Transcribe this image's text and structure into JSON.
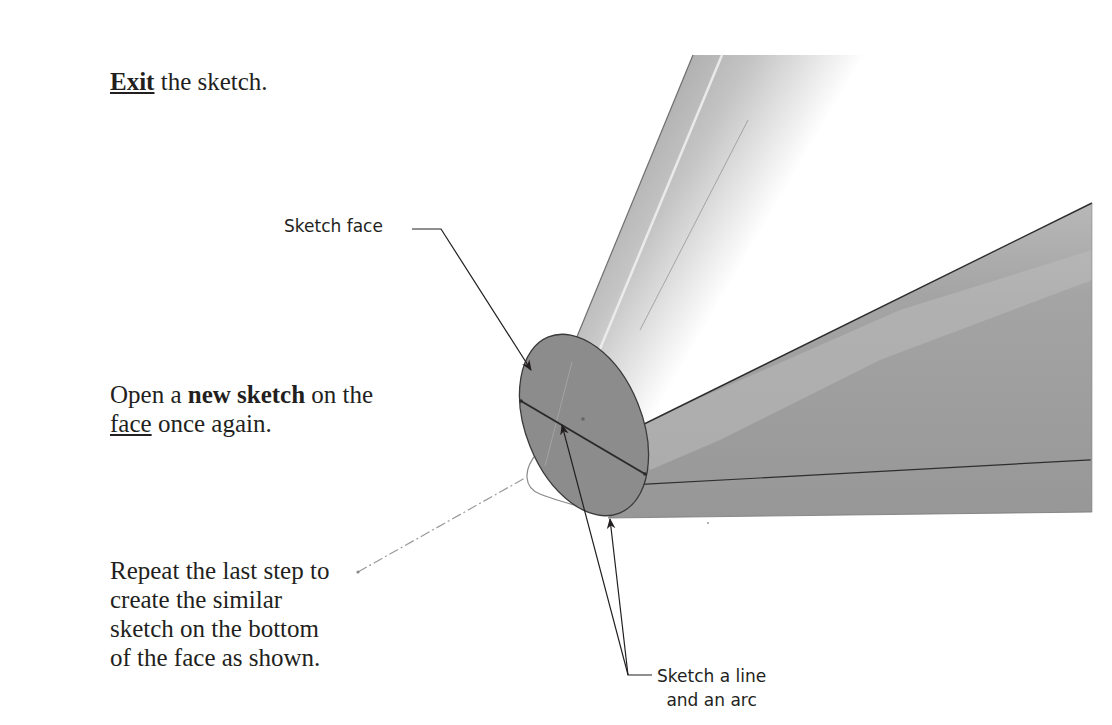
{
  "instructions": {
    "step1": {
      "bold_underlined": "Exit",
      "rest": " the sketch."
    },
    "step2": {
      "line1_prefix": "Open a ",
      "line1_bold": "new sketch",
      "line1_suffix": " on the",
      "line2_underlined": "face",
      "line2_suffix": " once again."
    },
    "step3": {
      "lines": [
        "Repeat the last step to",
        "create the similar",
        "sketch on the bottom",
        "of the face as shown."
      ]
    }
  },
  "figure": {
    "callouts": {
      "sketch_face": "Sketch face",
      "sketch_line_arc_line1": "Sketch a line",
      "sketch_line_arc_line2": "and an arc"
    },
    "colors": {
      "face_fill": "#8c8c8c",
      "body_gray": "#9a9a9a",
      "edge": "#333333",
      "leader": "#231f20"
    }
  }
}
